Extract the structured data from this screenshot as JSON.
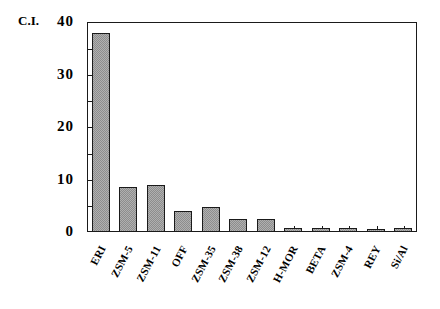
{
  "chart_data": {
    "type": "bar",
    "title": "",
    "subtitle": "",
    "xlabel": "",
    "ylabel": "C.I.",
    "ylim": [
      0,
      40
    ],
    "y_ticks": [
      0,
      10,
      20,
      30,
      40
    ],
    "y_minor_ticks": [
      5,
      15,
      25,
      35
    ],
    "grid": false,
    "legend": null,
    "categories": [
      "ERI",
      "ZSM-5",
      "ZSM-11",
      "OFF",
      "ZSM-35",
      "ZSM-38",
      "ZSM-12",
      "H-MOR",
      "BETA",
      "ZSM-4",
      "REY",
      "Si/Al"
    ],
    "values": [
      38,
      8.5,
      9,
      4,
      4.8,
      2.4,
      2.4,
      0.7,
      0.7,
      0.7,
      0.6,
      0.8
    ],
    "series": [
      {
        "name": "C.I.",
        "values": [
          38,
          8.5,
          9,
          4,
          4.8,
          2.4,
          2.4,
          0.7,
          0.7,
          0.7,
          0.6,
          0.8
        ]
      }
    ],
    "bar_fill_color": "#b0b0b0",
    "bar_edge_color": "#1a1a1a",
    "axis_color": "#1a1a1a",
    "background_color": "#ffffff"
  }
}
